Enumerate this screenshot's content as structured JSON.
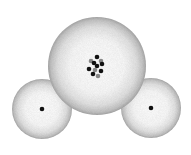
{
  "diagram": {
    "atoms": [
      {
        "name": "oxygen",
        "cx": 97,
        "cy": 66,
        "r": 49,
        "nucleus": "cluster"
      },
      {
        "name": "hydrogen-left",
        "cx": 42,
        "cy": 109,
        "r": 30,
        "nucleus": "dot"
      },
      {
        "name": "hydrogen-right",
        "cx": 151,
        "cy": 108,
        "r": 30,
        "nucleus": "dot"
      }
    ],
    "colors": {
      "cloud_edge": "#9a9a9a",
      "cloud_center": "#ffffff",
      "nucleus": "#111111",
      "nucleus_alt": "#777777"
    }
  }
}
